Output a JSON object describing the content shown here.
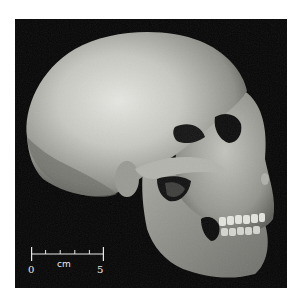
{
  "image": {
    "subject": "skull-lateral-view",
    "background_color": "#050505",
    "frame_color": "#ffffff"
  },
  "scale_bar": {
    "start_label": "0",
    "end_label": "5",
    "unit_label": "cm",
    "ticks": 6
  }
}
